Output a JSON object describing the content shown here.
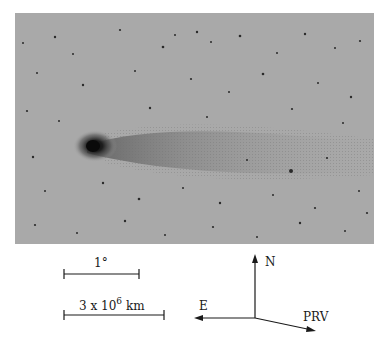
{
  "figure": {
    "image": {
      "description": "comet-photograph",
      "background_color": "#a9a9a9",
      "nucleus_color": "#111111"
    },
    "scale_bars": [
      {
        "label": "1°"
      },
      {
        "label_base": "3 x 10",
        "label_exp": "6",
        "label_unit": "km"
      }
    ],
    "compass": {
      "north_label": "N",
      "east_label": "E",
      "prv_label": "PRV"
    }
  }
}
